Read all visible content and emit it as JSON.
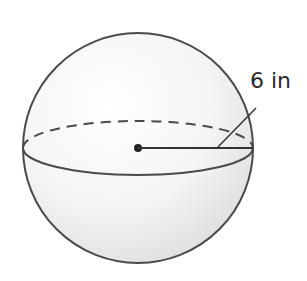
{
  "figure": {
    "shape": "sphere",
    "radius_label": "6 in",
    "colors": {
      "outline": "#4a4a4a",
      "fill_light": "#fafafa",
      "fill_shade": "#e4e4e4",
      "text": "#2a2a2a"
    }
  }
}
